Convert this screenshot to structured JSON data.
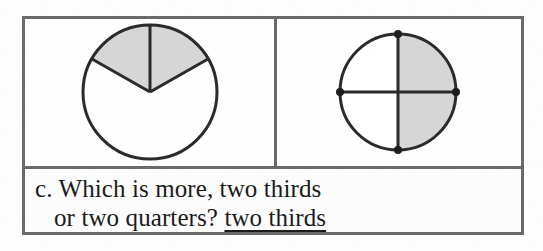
{
  "worksheet": {
    "question": {
      "label": "c.",
      "line_one": "c. Which is more, two thirds",
      "line_two_prompt": "or two quarters?",
      "answer": "two thirds"
    },
    "figures": {
      "left": {
        "name": "thirds-circle",
        "total_parts": 3,
        "shaded_parts": 2,
        "fraction_label": "two thirds",
        "shaded_color": "#d6d6d6",
        "unshaded_color": "#ffffff",
        "stroke_color": "#2b2b2b",
        "has_vertex_dots": false
      },
      "right": {
        "name": "quarters-circle",
        "total_parts": 4,
        "shaded_parts": 2,
        "fraction_label": "two quarters",
        "shaded_color": "#d6d6d6",
        "unshaded_color": "#ffffff",
        "stroke_color": "#2b2b2b",
        "has_vertex_dots": true,
        "dot_count": 4
      }
    },
    "colors": {
      "border": "#6a6a6a",
      "page_background": "#fdfdfd",
      "text": "#1b1b1b"
    }
  }
}
